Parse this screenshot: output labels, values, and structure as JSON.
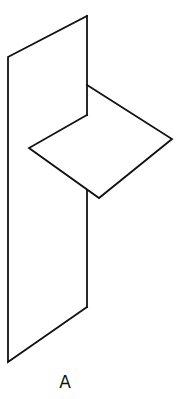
{
  "figure": {
    "label": "A",
    "stroke_color": "#111111",
    "background_color": "#ffffff"
  },
  "vertical_plane": {
    "name": "vertical-plane",
    "vertices": [
      [
        8,
        57
      ],
      [
        87,
        16
      ],
      [
        87,
        307
      ],
      [
        8,
        362
      ]
    ],
    "visible_right_edge_segments": [
      [
        [
          87,
          16
        ],
        [
          87,
          115
        ]
      ],
      [
        [
          87,
          191
        ],
        [
          87,
          307
        ]
      ]
    ]
  },
  "horizontal_plane": {
    "name": "horizontal-plane",
    "vertices": [
      [
        87,
        85
      ],
      [
        172,
        139
      ],
      [
        99,
        198
      ],
      [
        29,
        148
      ],
      [
        87,
        115
      ]
    ]
  }
}
